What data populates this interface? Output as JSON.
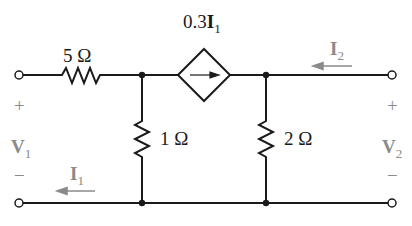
{
  "diagram": {
    "type": "two-port circuit",
    "colors": {
      "wire": "#1a1a1a",
      "labels_dark": "#1a1a1a",
      "labels_gray": "#8a8a8a"
    },
    "components": {
      "r_series": {
        "label": "5 Ω"
      },
      "r_left_shunt": {
        "label": "1 Ω"
      },
      "r_right_shunt": {
        "label": "2 Ω"
      },
      "dependent_source": {
        "type": "current-controlled current source",
        "coef": "0.3",
        "var": "I",
        "var_sub": "1"
      }
    },
    "port1": {
      "voltage_var": "V",
      "voltage_sub": "1",
      "plus": "+",
      "minus": "−",
      "current_var": "I",
      "current_sub": "1"
    },
    "port2": {
      "voltage_var": "V",
      "voltage_sub": "2",
      "plus": "+",
      "minus": "−",
      "current_var": "I",
      "current_sub": "2"
    }
  }
}
